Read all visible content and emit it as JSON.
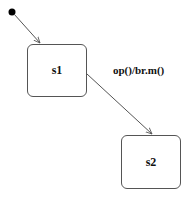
{
  "diagram": {
    "type": "state-machine",
    "initial": {
      "id": "initial",
      "cx": 12,
      "cy": 12,
      "r": 3.5
    },
    "states": [
      {
        "id": "s1",
        "label": "s1",
        "x": 27,
        "y": 44,
        "w": 60,
        "h": 53
      },
      {
        "id": "s2",
        "label": "s2",
        "x": 121,
        "y": 135,
        "w": 60,
        "h": 54
      }
    ],
    "transitions": [
      {
        "from": "initial",
        "to": "s1",
        "label": "",
        "x1": 14,
        "y1": 14,
        "x2": 40,
        "y2": 43
      },
      {
        "from": "s1",
        "to": "s2",
        "label": "op()/br.m()",
        "x1": 87,
        "y1": 74,
        "x2": 152,
        "y2": 134,
        "label_x": 113,
        "label_y": 64
      }
    ],
    "colors": {
      "line": "#555555",
      "fill": "#ffffff",
      "text": "#111111",
      "dot": "#000000"
    }
  }
}
